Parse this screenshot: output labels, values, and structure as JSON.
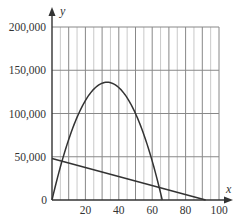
{
  "chart_data": {
    "type": "line",
    "title": "",
    "xlabel": "x",
    "ylabel": "y",
    "xlim": [
      0,
      100
    ],
    "ylim": [
      0,
      200000
    ],
    "x_ticks": [
      20,
      40,
      60,
      80,
      100
    ],
    "x_tick_labels": [
      "20",
      "40",
      "60",
      "80",
      "100"
    ],
    "y_ticks": [
      0,
      50000,
      100000,
      150000,
      200000
    ],
    "y_tick_labels": [
      "0",
      "50,000",
      "100,000",
      "150,000",
      "200,000"
    ],
    "grid": {
      "vertical_minor_step": 5,
      "vertical_major_step": 10,
      "horizontal_step": 50000
    },
    "legend": null,
    "series": [
      {
        "name": "parabola",
        "kind": "quadratic",
        "x": [
          0,
          5,
          10,
          15,
          20,
          25,
          30,
          33,
          35,
          40,
          45,
          50,
          55,
          60,
          65,
          66
        ],
        "y": [
          0,
          37875,
          69500,
          95000,
          111500,
          127750,
          129000,
          136125,
          134750,
          128000,
          118125,
          102000,
          85250,
          62000,
          14625,
          0
        ],
        "roots": [
          0,
          66
        ],
        "vertex": [
          33,
          136125
        ]
      },
      {
        "name": "line",
        "kind": "linear",
        "x": [
          0,
          92
        ],
        "y": [
          48000,
          0
        ]
      }
    ]
  },
  "axes": {
    "x_label": "x",
    "y_label": "y",
    "origin_label": "0"
  },
  "colors": {
    "curve": "#333333",
    "grid_major": "#888888",
    "grid_minor": "#bbbbbb",
    "axis": "#333333"
  }
}
